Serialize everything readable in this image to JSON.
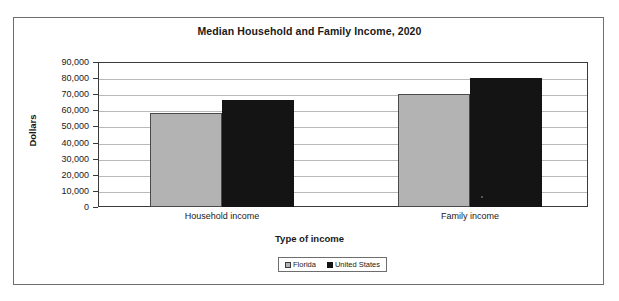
{
  "chart_data": {
    "type": "bar",
    "title": "Median Household and Family Income, 2020",
    "xlabel": "Type of income",
    "ylabel": "Dollars",
    "categories": [
      "Household income",
      "Family income"
    ],
    "series": [
      {
        "name": "Florida",
        "color": "#b3b3b3",
        "values": [
          58300,
          70100
        ]
      },
      {
        "name": "United States",
        "color": "#141414",
        "values": [
          66400,
          80000
        ]
      }
    ],
    "ylim": [
      0,
      90000
    ],
    "ytick_values": [
      0,
      10000,
      20000,
      30000,
      40000,
      50000,
      60000,
      70000,
      80000,
      90000
    ],
    "ytick_labels": [
      "0",
      "10,000",
      "20,000",
      "30,000",
      "40,000",
      "50,000",
      "60,000",
      "70,000",
      "80,000",
      "90,000"
    ],
    "grid": true,
    "legend_position": "bottom",
    "legend_entries": [
      "Florida",
      "United States"
    ]
  },
  "legend": {
    "items": [
      {
        "label": "Florida",
        "swatch": "legend-swatch-florida"
      },
      {
        "label": "United States",
        "swatch": "legend-swatch-united-states"
      }
    ]
  }
}
